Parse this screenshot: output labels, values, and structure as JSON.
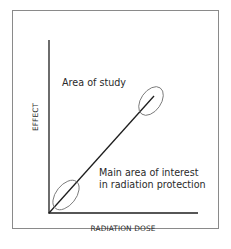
{
  "diagram": {
    "type": "dose-effect relationship diagram",
    "frame": {
      "border_color": "#8a8a8a",
      "background": "#ffffff"
    },
    "axes": {
      "x_label": "RADIATION DOSE",
      "y_label": "EFFECT",
      "color": "#1e1e1e"
    },
    "line": {
      "description": "linear dose-effect line from origin",
      "color": "#1e1e1e"
    },
    "regions": [
      {
        "id": "high-dose",
        "label": "Area of study",
        "ellipse_color": "#7a7a7a"
      },
      {
        "id": "low-dose",
        "label_line1": "Main area of interest",
        "label_line2": "in radiation protection",
        "ellipse_color": "#7a7a7a"
      }
    ]
  }
}
